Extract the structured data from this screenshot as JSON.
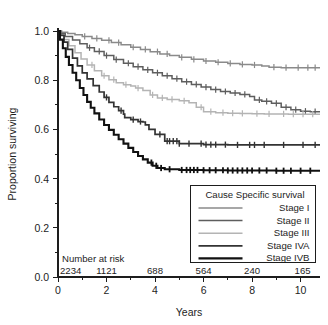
{
  "chart_data": {
    "type": "line",
    "title": "",
    "subtitle": "",
    "xlabel": "Years",
    "ylabel": "Proportion surviving",
    "xlim": [
      0,
      10.8
    ],
    "ylim": [
      0.0,
      1.0
    ],
    "grid": false,
    "legend_position": "bottom-right",
    "legend_title": "Cause Specific survival",
    "x_ticks_major": [
      0,
      2,
      4,
      6,
      8,
      10
    ],
    "x_tick_labels": [
      "0",
      "2",
      "4",
      "6",
      "8",
      "10"
    ],
    "x_ticks_minor": [
      1,
      3,
      5,
      7,
      9
    ],
    "y_ticks_major": [
      0.0,
      0.2,
      0.4,
      0.6,
      0.8,
      1.0
    ],
    "y_tick_labels": [
      "0.0",
      "0.2",
      "0.4",
      "0.6",
      "0.8",
      "1.0"
    ],
    "y_ticks_minor": [
      0.1,
      0.3,
      0.5,
      0.7,
      0.9
    ],
    "series": [
      {
        "name": "Stage I",
        "color": "#8a8a8a",
        "width": 1.5,
        "final_value": 0.85,
        "x": [
          0,
          0.15,
          0.4,
          0.7,
          1.0,
          1.4,
          1.8,
          2.2,
          2.6,
          3.0,
          3.4,
          3.8,
          4.2,
          4.6,
          5.0,
          5.5,
          6.0,
          6.5,
          7.0,
          7.5,
          8.0,
          8.4,
          8.7,
          9.2,
          9.8,
          10.4,
          10.75
        ],
        "y": [
          1.0,
          0.995,
          0.99,
          0.985,
          0.978,
          0.97,
          0.962,
          0.953,
          0.944,
          0.934,
          0.925,
          0.916,
          0.907,
          0.9,
          0.893,
          0.885,
          0.878,
          0.873,
          0.868,
          0.864,
          0.862,
          0.858,
          0.853,
          0.851,
          0.851,
          0.851,
          0.851
        ],
        "censors_x": [
          1.1,
          1.6,
          2.1,
          2.5,
          3.1,
          3.6,
          4.1,
          4.5,
          5.1,
          5.6,
          6.1,
          6.6,
          7.1,
          7.6,
          8.1,
          8.9,
          9.4,
          9.9,
          10.3,
          10.6
        ]
      },
      {
        "name": "Stage II",
        "color": "#5e5e5e",
        "width": 1.5,
        "final_value": 0.672,
        "x": [
          0,
          0.1,
          0.3,
          0.6,
          0.9,
          1.2,
          1.5,
          1.9,
          2.3,
          2.7,
          3.1,
          3.5,
          3.9,
          4.3,
          4.7,
          5.1,
          5.5,
          5.9,
          6.3,
          6.7,
          7.1,
          7.5,
          7.9,
          8.1,
          8.4,
          8.8,
          9.2,
          9.6,
          10.0,
          10.4,
          10.75
        ],
        "y": [
          1.0,
          0.99,
          0.978,
          0.963,
          0.948,
          0.932,
          0.917,
          0.9,
          0.884,
          0.869,
          0.855,
          0.842,
          0.83,
          0.818,
          0.806,
          0.794,
          0.783,
          0.772,
          0.762,
          0.754,
          0.748,
          0.742,
          0.734,
          0.72,
          0.714,
          0.706,
          0.69,
          0.68,
          0.674,
          0.672,
          0.672
        ],
        "censors_x": [
          1.3,
          1.7,
          2.0,
          2.4,
          2.9,
          3.3,
          3.7,
          4.1,
          4.5,
          4.9,
          5.3,
          5.7,
          6.1,
          6.5,
          6.9,
          7.3,
          7.7,
          8.3,
          8.6,
          9.0,
          9.4,
          9.8,
          10.2,
          10.6
        ]
      },
      {
        "name": "Stage III",
        "color": "#b4b4b4",
        "width": 1.5,
        "final_value": 0.662,
        "x": [
          0,
          0.1,
          0.25,
          0.45,
          0.7,
          0.95,
          1.2,
          1.5,
          1.8,
          2.1,
          2.4,
          2.7,
          3.0,
          3.2,
          3.5,
          3.8,
          4.1,
          4.5,
          5.0,
          5.4,
          5.7,
          6.0,
          6.5,
          7.0,
          7.5,
          8.0,
          8.5,
          9.0,
          9.5,
          10.0,
          10.4,
          10.75
        ],
        "y": [
          1.0,
          0.985,
          0.965,
          0.94,
          0.912,
          0.886,
          0.862,
          0.838,
          0.818,
          0.802,
          0.79,
          0.782,
          0.776,
          0.768,
          0.758,
          0.74,
          0.728,
          0.722,
          0.716,
          0.708,
          0.69,
          0.672,
          0.668,
          0.666,
          0.665,
          0.664,
          0.663,
          0.663,
          0.662,
          0.662,
          0.662,
          0.662
        ],
        "censors_x": [
          1.4,
          1.9,
          2.3,
          2.8,
          3.3,
          3.9,
          4.3,
          4.7,
          5.2,
          5.9,
          6.3,
          6.8,
          7.2,
          7.6,
          8.2,
          8.7,
          9.3,
          9.7,
          10.1,
          10.5
        ]
      },
      {
        "name": "Stage IVA",
        "color": "#333333",
        "width": 1.7,
        "final_value": 0.537,
        "x": [
          0,
          0.1,
          0.25,
          0.4,
          0.6,
          0.8,
          1.0,
          1.2,
          1.45,
          1.7,
          1.9,
          2.1,
          2.3,
          2.5,
          2.7,
          2.75,
          3.0,
          3.3,
          3.5,
          3.6,
          3.75,
          4.0,
          4.4,
          5.0,
          6.0,
          7.0,
          8.0,
          9.0,
          10.0,
          10.75
        ],
        "y": [
          1.0,
          0.982,
          0.955,
          0.925,
          0.89,
          0.858,
          0.83,
          0.805,
          0.778,
          0.752,
          0.73,
          0.71,
          0.692,
          0.676,
          0.662,
          0.648,
          0.64,
          0.632,
          0.63,
          0.618,
          0.6,
          0.58,
          0.552,
          0.542,
          0.538,
          0.537,
          0.537,
          0.537,
          0.537,
          0.537
        ],
        "censors_x": [
          2.0,
          2.6,
          3.1,
          3.4,
          4.2,
          4.5,
          4.6,
          4.75,
          4.9,
          5.0,
          5.4,
          5.9,
          6.1,
          6.3,
          6.5,
          6.9,
          7.4,
          7.9,
          8.1,
          8.5,
          9.3,
          10.1,
          10.6
        ]
      },
      {
        "name": "Stage IVB",
        "color": "#111111",
        "width": 2.1,
        "final_value": 0.432,
        "x": [
          0,
          0.08,
          0.2,
          0.32,
          0.45,
          0.6,
          0.75,
          0.9,
          1.05,
          1.2,
          1.35,
          1.5,
          1.7,
          1.9,
          2.1,
          2.3,
          2.5,
          2.7,
          2.9,
          3.1,
          3.3,
          3.5,
          3.7,
          3.9,
          4.1,
          4.4,
          5.0,
          6.0,
          7.0,
          8.0,
          9.0,
          10.0,
          10.75
        ],
        "y": [
          1.0,
          0.965,
          0.93,
          0.895,
          0.862,
          0.83,
          0.8,
          0.768,
          0.74,
          0.712,
          0.688,
          0.665,
          0.64,
          0.618,
          0.598,
          0.578,
          0.56,
          0.542,
          0.525,
          0.508,
          0.492,
          0.478,
          0.465,
          0.452,
          0.443,
          0.438,
          0.435,
          0.434,
          0.433,
          0.433,
          0.432,
          0.432,
          0.432
        ],
        "censors_x": [
          3.85,
          4.05,
          4.25,
          4.6,
          5.1,
          5.3,
          5.45,
          5.6,
          5.75,
          6.0,
          6.25,
          6.5,
          6.8,
          7.0,
          7.2,
          7.4,
          7.6,
          7.8,
          8.0,
          8.3,
          8.6,
          9.0,
          9.3,
          9.6,
          10.0,
          10.4
        ]
      }
    ],
    "risk_table": {
      "label": "Number at risk",
      "x_positions": [
        0,
        2,
        4,
        6,
        8,
        10
      ],
      "counts": [
        "2234",
        "1121",
        "688",
        "564",
        "240",
        "165"
      ]
    }
  },
  "legend": {
    "title": "Cause Specific survival",
    "entries": [
      {
        "label": "Stage I"
      },
      {
        "label": "Stage II"
      },
      {
        "label": "Stage III"
      },
      {
        "label": "Stage IVA"
      },
      {
        "label": "Stage IVB"
      }
    ]
  },
  "axes": {
    "y_title": "Proportion surviving",
    "x_title": "Years"
  }
}
